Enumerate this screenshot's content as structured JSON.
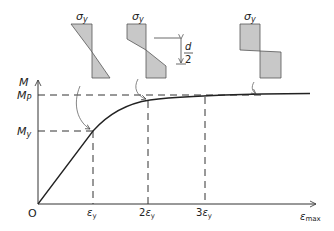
{
  "figure": {
    "type": "moment-curvature diagram",
    "y_axis_label": "M",
    "x_axis_label": "ε",
    "x_axis_label_sub": "max",
    "origin_label": "O",
    "y_ticks": [
      {
        "label": "M",
        "sub": "P"
      },
      {
        "label": "M",
        "sub": "y"
      }
    ],
    "x_ticks": [
      {
        "label": "ε",
        "sub": "y",
        "prefix": ""
      },
      {
        "label": "ε",
        "sub": "y",
        "prefix": "2"
      },
      {
        "label": "ε",
        "sub": "y",
        "prefix": "3"
      }
    ],
    "stress_diagrams": [
      {
        "label": "σ",
        "sub": "y",
        "shape": "linear (elastic)"
      },
      {
        "label": "σ",
        "sub": "y",
        "shape": "partially plastic"
      },
      {
        "label": "σ",
        "sub": "y",
        "shape": "fully plastic"
      }
    ],
    "dimension_label": {
      "num": "d",
      "den": "2"
    },
    "colors": {
      "fill": "#c8c8c8",
      "stroke": "#444444",
      "line": "#222222"
    }
  }
}
